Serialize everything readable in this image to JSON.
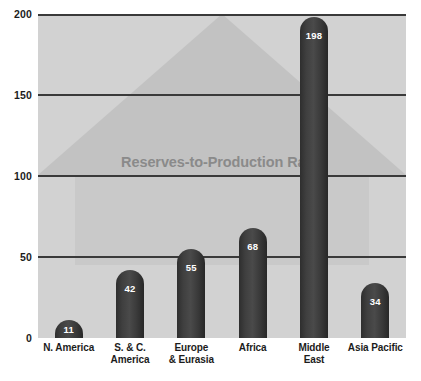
{
  "chart_data": {
    "type": "bar",
    "title": "",
    "annotation": "Reserves-to-Production Ratio",
    "xlabel": "",
    "ylabel": "",
    "ylim": [
      0,
      200
    ],
    "yticks": [
      0,
      50,
      100,
      150,
      200
    ],
    "ytick_labels": [
      "0",
      "50",
      "100",
      "150",
      "200"
    ],
    "grid": true,
    "grid_axis": "y",
    "legend": false,
    "categories": [
      "N. America",
      "S. & C. America",
      "Europe & Eurasia",
      "Africa",
      "Middle East",
      "Asia Pacific"
    ],
    "category_lines": [
      [
        "N. America"
      ],
      [
        "S. & C.",
        "America"
      ],
      [
        "Europe",
        "& Eurasia"
      ],
      [
        "Africa"
      ],
      [
        "Middle",
        "East"
      ],
      [
        "Asia Pacific"
      ]
    ],
    "values": [
      11,
      42,
      55,
      68,
      198,
      34
    ],
    "value_labels": [
      "11",
      "42",
      "55",
      "68",
      "198",
      "34"
    ],
    "colors": {
      "bar": "#3a3a3a",
      "plot_background": "#d2d2d2",
      "watermark_shape": "#c2c2c2",
      "watermark_text": "#8a8a8a",
      "gridline": "#3a3a3a",
      "axis_text": "#1c1c1c",
      "value_label": "#ffffff",
      "page_background": "#ffffff"
    }
  }
}
